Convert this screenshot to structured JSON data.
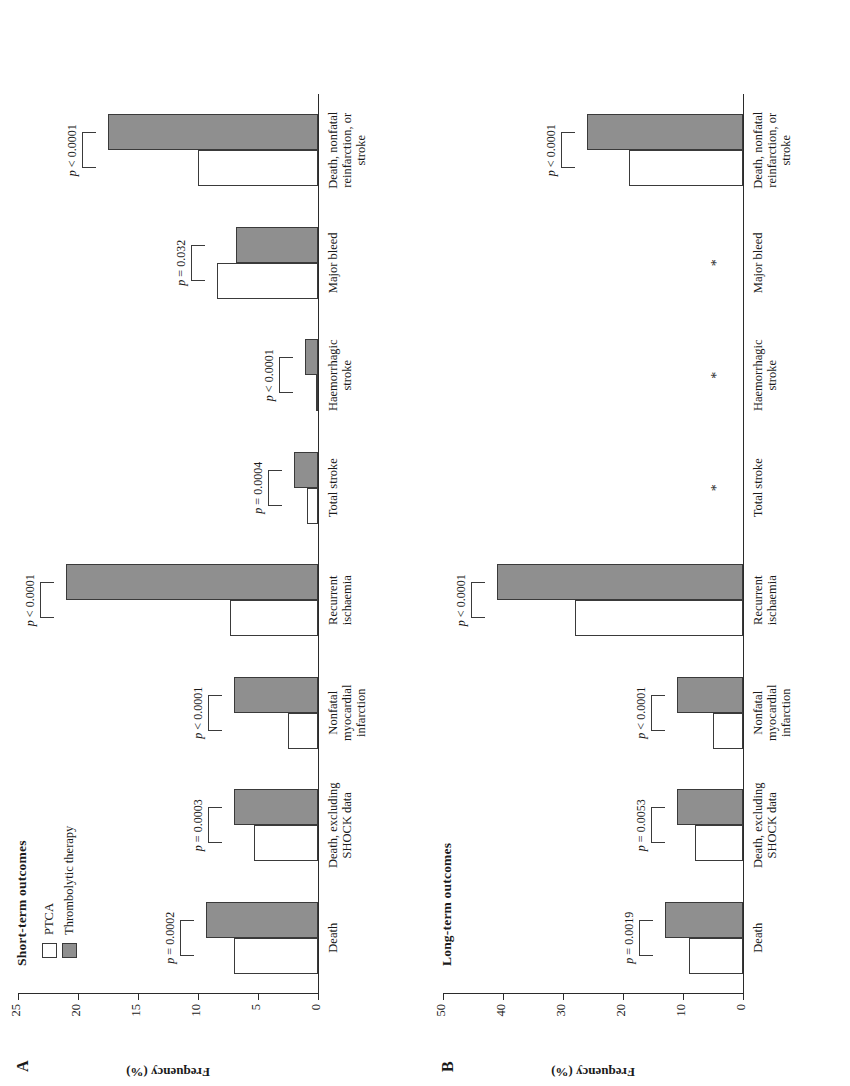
{
  "figure": {
    "panels": [
      {
        "letter": "A",
        "title": "Short-term outcomes",
        "ylabel": "Frequency (%)",
        "yticks": [
          0,
          5,
          10,
          15,
          20,
          25
        ],
        "ymax": 25,
        "legend": [
          {
            "key": "ptca",
            "label": "PTCA"
          },
          {
            "key": "throm",
            "label": "Thrombolytic therapy"
          }
        ]
      },
      {
        "letter": "B",
        "title": "Long-term outcomes",
        "ylabel": "Frequency (%)",
        "yticks": [
          0,
          10,
          20,
          30,
          40,
          50
        ],
        "ymax": 50
      }
    ]
  },
  "chart_data": [
    {
      "type": "bar",
      "title": "Short-term outcomes",
      "panel": "A",
      "xlabel": "",
      "ylabel": "Frequency (%)",
      "ylim": [
        0,
        25
      ],
      "yticks": [
        0,
        5,
        10,
        15,
        20,
        25
      ],
      "grid": false,
      "legend_position": "top-left",
      "categories": [
        "Death",
        "Death, excluding SHOCK data",
        "Nonfatal myocardial infarction",
        "Recurrent ischaemia",
        "Total stroke",
        "Haemorrhagic stroke",
        "Major bleed",
        "Death, nonfatal reinfarction, or stroke"
      ],
      "series": [
        {
          "name": "PTCA",
          "values": [
            7.0,
            5.3,
            2.5,
            7.3,
            0.9,
            0.05,
            8.4,
            10.0
          ]
        },
        {
          "name": "Thrombolytic therapy",
          "values": [
            9.3,
            7.0,
            7.0,
            21.0,
            2.0,
            1.1,
            6.8,
            17.5
          ]
        }
      ],
      "annotations": [
        {
          "category": "Death",
          "p": "p = 0.0002"
        },
        {
          "category": "Death, excluding SHOCK data",
          "p": "p = 0.0003"
        },
        {
          "category": "Nonfatal myocardial infarction",
          "p": "p < 0.0001"
        },
        {
          "category": "Recurrent ischaemia",
          "p": "p < 0.0001"
        },
        {
          "category": "Total stroke",
          "p": "p = 0.0004"
        },
        {
          "category": "Haemorrhagic stroke",
          "p": "p < 0.0001"
        },
        {
          "category": "Major bleed",
          "p": "p = 0.032"
        },
        {
          "category": "Death, nonfatal reinfarction, or stroke",
          "p": "p < 0.0001"
        }
      ]
    },
    {
      "type": "bar",
      "title": "Long-term outcomes",
      "panel": "B",
      "xlabel": "",
      "ylabel": "Frequency (%)",
      "ylim": [
        0,
        50
      ],
      "yticks": [
        0,
        10,
        20,
        30,
        40,
        50
      ],
      "grid": false,
      "legend_position": "none",
      "categories": [
        "Death",
        "Death, excluding SHOCK data",
        "Nonfatal myocardial infarction",
        "Recurrent ischaemia",
        "Total stroke",
        "Haemorrhagic stroke",
        "Major bleed",
        "Death, nonfatal reinfarction, or stroke"
      ],
      "series": [
        {
          "name": "PTCA",
          "values": [
            9.0,
            8.0,
            5.0,
            28.0,
            null,
            null,
            null,
            19.0
          ]
        },
        {
          "name": "Thrombolytic therapy",
          "values": [
            13.0,
            11.0,
            11.0,
            41.0,
            null,
            null,
            null,
            26.0
          ]
        }
      ],
      "annotations": [
        {
          "category": "Death",
          "p": "p = 0.0019"
        },
        {
          "category": "Death, excluding SHOCK data",
          "p": "p = 0.0053"
        },
        {
          "category": "Nonfatal myocardial infarction",
          "p": "p < 0.0001"
        },
        {
          "category": "Recurrent ischaemia",
          "p": "p < 0.0001"
        },
        {
          "category": "Total stroke",
          "p": "*"
        },
        {
          "category": "Haemorrhagic stroke",
          "p": "*"
        },
        {
          "category": "Major bleed",
          "p": "*"
        },
        {
          "category": "Death, nonfatal reinfarction, or stroke",
          "p": "p < 0.0001"
        }
      ],
      "no_data_marker": "*"
    }
  ],
  "colors": {
    "ptca_fill": "#ffffff",
    "thrombolytic_fill": "#8f8f8f",
    "stroke": "#3a3a3a",
    "background": "#ffffff"
  }
}
